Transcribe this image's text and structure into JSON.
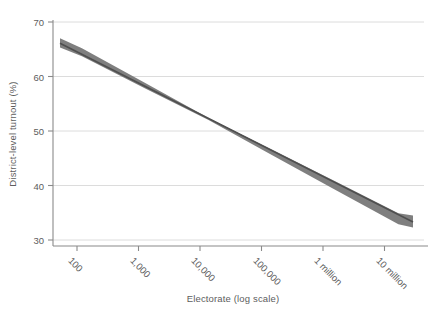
{
  "chart_data": {
    "type": "line",
    "title": "",
    "subtitle": "",
    "xlabel": "Electorate (log scale)",
    "ylabel": "District-level turnout (%)",
    "x_scale": "log",
    "xlim": [
      40,
      20000000
    ],
    "ylim": [
      29,
      70.5
    ],
    "xticks": [
      100,
      1000,
      10000,
      100000,
      1000000,
      10000000
    ],
    "xtick_labels": [
      "100",
      "1,000",
      "10,000",
      "100,000",
      "1 million",
      "10 million"
    ],
    "yticks": [
      30,
      40,
      50,
      60,
      70
    ],
    "ytick_labels": [
      "30",
      "40",
      "50",
      "60",
      "70"
    ],
    "grid": "horizontal",
    "legend": "none",
    "annotations": [],
    "series": [
      {
        "name": "Predicted district-level turnout",
        "type": "line",
        "color": "#4f4f4f",
        "x": [
          45,
          100,
          1000,
          10000,
          100000,
          1000000,
          10000000,
          17000000
        ],
        "values": [
          66.1,
          64.4,
          58.3,
          52.2,
          46.1,
          40.0,
          33.9,
          33.3
        ]
      },
      {
        "name": "95% confidence interval (upper)",
        "type": "band-upper",
        "color": "#7b7b7b",
        "x": [
          45,
          100,
          1000,
          10000,
          100000,
          1000000,
          10000000,
          17000000
        ],
        "values": [
          67.0,
          65.2,
          58.8,
          52.4,
          46.6,
          40.8,
          34.9,
          34.5
        ]
      },
      {
        "name": "95% confidence interval (lower)",
        "type": "band-lower",
        "color": "#7b7b7b",
        "x": [
          45,
          100,
          1000,
          10000,
          100000,
          1000000,
          10000000,
          17000000
        ],
        "values": [
          65.3,
          63.7,
          57.8,
          52.0,
          45.6,
          39.2,
          32.9,
          32.3
        ]
      }
    ],
    "colors": {
      "band": "#7b7b7b",
      "line": "#4f4f4f",
      "grid": "#d9d9d9",
      "axis": "#7a7a7a",
      "text": "#5d5d5d",
      "background": "#ffffff"
    }
  }
}
